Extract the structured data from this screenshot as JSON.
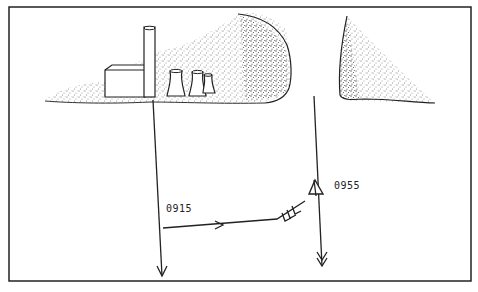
{
  "diagram": {
    "type": "track-sketch",
    "frame": {
      "x": 9,
      "y": 7,
      "w": 462,
      "h": 274,
      "stroke": "#222222"
    },
    "landscape": {
      "left_landmass": {
        "shading": "stipple",
        "color": "#555555"
      },
      "right_landmass": {
        "shading": "stipple",
        "color": "#555555"
      }
    },
    "structures": [
      {
        "name": "building",
        "kind": "rectangular-building"
      },
      {
        "name": "chimney",
        "kind": "tall-stack"
      },
      {
        "name": "cooling-tower-1",
        "kind": "cooling-tower"
      },
      {
        "name": "cooling-tower-2",
        "kind": "cooling-tower"
      },
      {
        "name": "cooling-tower-3",
        "kind": "cooling-tower"
      }
    ],
    "tracks": [
      {
        "name": "left-track",
        "direction": "down"
      },
      {
        "name": "right-track",
        "direction": "down"
      },
      {
        "name": "connecting-track",
        "direction": "right",
        "note": "multiple arrowheads toward triangle"
      }
    ],
    "markers": [
      {
        "name": "triangle-marker",
        "shape": "triangle"
      }
    ],
    "labels": {
      "time_1": "0915",
      "time_2": "0955"
    }
  }
}
